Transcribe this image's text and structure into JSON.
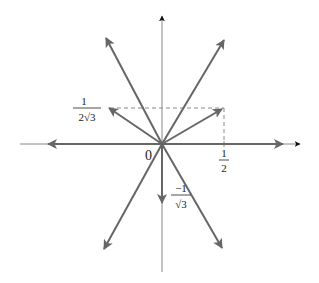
{
  "diagram": {
    "title": "",
    "origin_label": "0",
    "x_tick_label": {
      "numerator": "1",
      "denominator": "2"
    },
    "y_tick_label": {
      "numerator": "1",
      "denominator": "2√3"
    },
    "down_vector_label": {
      "numerator": "−1",
      "denominator": "√3"
    },
    "colors": {
      "axis": "#888888",
      "axis_arrow": "#111111",
      "vector": "#666666",
      "dashed": "#888888",
      "text": "#222222"
    },
    "origin_px": [
      162,
      144
    ],
    "vectors": [
      {
        "name": "long-upper-left",
        "tip": [
          106,
          38
        ]
      },
      {
        "name": "long-upper-right",
        "tip": [
          224,
          40
        ]
      },
      {
        "name": "long-lower-left",
        "tip": [
          104,
          249
        ]
      },
      {
        "name": "long-lower-right",
        "tip": [
          222,
          248
        ]
      },
      {
        "name": "short-upper-left",
        "tip": [
          109,
          108
        ]
      },
      {
        "name": "short-upper-right",
        "tip": [
          222,
          109
        ]
      },
      {
        "name": "horizontal-right",
        "tip": [
          283,
          144
        ]
      },
      {
        "name": "horizontal-left",
        "tip": [
          48,
          144
        ]
      },
      {
        "name": "down",
        "tip": [
          162,
          203
        ]
      }
    ]
  }
}
